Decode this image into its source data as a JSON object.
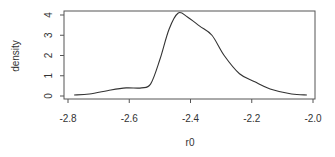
{
  "chart_data": {
    "type": "line",
    "title": "",
    "xlabel": "r0",
    "ylabel": "density",
    "xlim": [
      -2.8,
      -2.0
    ],
    "ylim": [
      0,
      4
    ],
    "xticks": [
      "-2.8",
      "-2.6",
      "-2.4",
      "-2.2",
      "-2.0"
    ],
    "xtick_values": [
      -2.8,
      -2.6,
      -2.4,
      -2.2,
      -2.0
    ],
    "yticks": [
      "0",
      "1",
      "2",
      "3",
      "4"
    ],
    "ytick_values": [
      0,
      1,
      2,
      3,
      4
    ],
    "grid": false,
    "legend": null,
    "series": [
      {
        "name": "density",
        "x": [
          -2.78,
          -2.73,
          -2.66,
          -2.61,
          -2.56,
          -2.53,
          -2.5,
          -2.47,
          -2.44,
          -2.41,
          -2.37,
          -2.33,
          -2.29,
          -2.24,
          -2.19,
          -2.14,
          -2.07,
          -2.02
        ],
        "y": [
          0.05,
          0.1,
          0.3,
          0.4,
          0.4,
          0.6,
          1.8,
          3.3,
          4.1,
          3.9,
          3.45,
          3.0,
          2.0,
          1.1,
          0.7,
          0.35,
          0.1,
          0.05
        ]
      }
    ]
  }
}
